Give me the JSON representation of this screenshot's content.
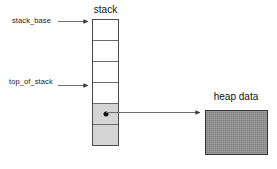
{
  "diagram": {
    "stack": {
      "title": "stack",
      "cell_count": 6,
      "filled_cells": [
        4,
        5
      ],
      "pointer_cell_index": 4,
      "border_color": "#4a4a4a",
      "filled_color": "#d4d4d4",
      "empty_color": "#ffffff"
    },
    "heap": {
      "title": "heap data",
      "fill_color": "#8e8e8e",
      "border_color": "#333333"
    },
    "labels": {
      "stack_base": "stack_base",
      "top_of_stack": "top_of_stack"
    },
    "arrows": [
      {
        "name": "stack-base-arrow",
        "from_x": 58,
        "from_y": 21,
        "to_x": 91,
        "to_y": 21
      },
      {
        "name": "top-of-stack-arrow",
        "from_x": 58,
        "from_y": 85,
        "to_x": 91,
        "to_y": 85
      },
      {
        "name": "heap-pointer-arrow",
        "from_x": 106,
        "from_y": 112,
        "to_x": 203,
        "to_y": 112
      }
    ],
    "line_color": "#6e6e6e"
  }
}
